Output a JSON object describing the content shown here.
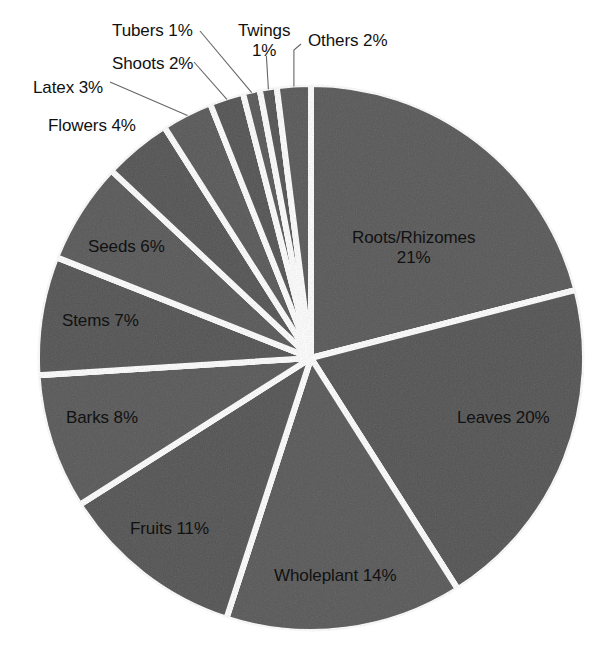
{
  "chart_data": {
    "type": "pie",
    "title": "",
    "subtitle": "",
    "xlabel": "",
    "ylabel": "",
    "units": "percent",
    "legend": "none",
    "grid": false,
    "start_angle_deg": 0,
    "direction": "clockwise",
    "total": 100,
    "categories": [
      "Roots/Rhizomes",
      "Leaves",
      "Wholeplant",
      "Fruits",
      "Barks",
      "Stems",
      "Seeds",
      "Flowers",
      "Latex",
      "Shoots",
      "Tubers",
      "Twings",
      "Others"
    ],
    "values": [
      21,
      20,
      14,
      11,
      8,
      7,
      6,
      4,
      3,
      2,
      1,
      1,
      2
    ],
    "slices": [
      {
        "name": "roots-rhizomes",
        "label": "Roots/Rhizomes\n21%",
        "label_line1": "Roots/Rhizomes",
        "label_line2": "21%",
        "value": 21,
        "start_deg": 0,
        "end_deg": 75.6,
        "label_x": 352,
        "label_y": 228,
        "leader": false,
        "multiline": true
      },
      {
        "name": "leaves",
        "label": "Leaves 20%",
        "value": 20,
        "start_deg": 75.6,
        "end_deg": 147.6,
        "label_x": 457,
        "label_y": 408,
        "leader": false,
        "multiline": false
      },
      {
        "name": "wholeplant",
        "label": "Wholeplant 14%",
        "value": 14,
        "start_deg": 147.6,
        "end_deg": 198.0,
        "label_x": 274,
        "label_y": 566,
        "leader": false,
        "multiline": false
      },
      {
        "name": "fruits",
        "label": "Fruits 11%",
        "value": 11,
        "start_deg": 198.0,
        "end_deg": 237.6,
        "label_x": 130,
        "label_y": 519,
        "leader": false,
        "multiline": false
      },
      {
        "name": "barks",
        "label": "Barks 8%",
        "value": 8,
        "start_deg": 237.6,
        "end_deg": 266.4,
        "label_x": 66,
        "label_y": 408,
        "leader": false,
        "multiline": false
      },
      {
        "name": "stems",
        "label": "Stems 7%",
        "value": 7,
        "start_deg": 266.4,
        "end_deg": 291.6,
        "label_x": 62,
        "label_y": 311,
        "leader": false,
        "multiline": false
      },
      {
        "name": "seeds",
        "label": "Seeds 6%",
        "value": 6,
        "start_deg": 291.6,
        "end_deg": 313.2,
        "label_x": 88,
        "label_y": 237,
        "leader": false,
        "multiline": false
      },
      {
        "name": "flowers",
        "label": "Flowers 4%",
        "value": 4,
        "start_deg": 313.2,
        "end_deg": 327.6,
        "label_x": 48,
        "label_y": 116,
        "leader": false,
        "multiline": false
      },
      {
        "name": "latex",
        "label": "Latex 3%",
        "value": 3,
        "start_deg": 327.6,
        "end_deg": 338.4,
        "label_x": 33,
        "label_y": 78,
        "leader": true,
        "multiline": false
      },
      {
        "name": "shoots",
        "label": "Shoots 2%",
        "value": 2,
        "start_deg": 338.4,
        "end_deg": 345.6,
        "label_x": 112,
        "label_y": 54,
        "leader": true,
        "multiline": false
      },
      {
        "name": "tubers",
        "label": "Tubers 1%",
        "value": 1,
        "start_deg": 345.6,
        "end_deg": 349.2,
        "label_x": 112,
        "label_y": 21,
        "leader": true,
        "multiline": false
      },
      {
        "name": "twings",
        "label": "Twings 1%",
        "label_line1": "Twings",
        "label_line2": "1%",
        "value": 1,
        "start_deg": 349.2,
        "end_deg": 352.8,
        "label_x": 238,
        "label_y": 21,
        "leader": true,
        "multiline": true
      },
      {
        "name": "others",
        "label": "Others 2%",
        "value": 2,
        "start_deg": 352.8,
        "end_deg": 360.0,
        "label_x": 308,
        "label_y": 31,
        "leader": true,
        "multiline": false
      }
    ],
    "style": {
      "slice_fill": "#9a9a9a",
      "slice_fill_alt": "#969696",
      "separator_color": "#ffffff",
      "separator_width_px": 6,
      "label_color": "#111111",
      "leader_color": "#666666",
      "background": "#ffffff",
      "texture": "noise"
    },
    "geometry": {
      "center_x": 311,
      "center_y": 358,
      "radius": 274
    }
  }
}
